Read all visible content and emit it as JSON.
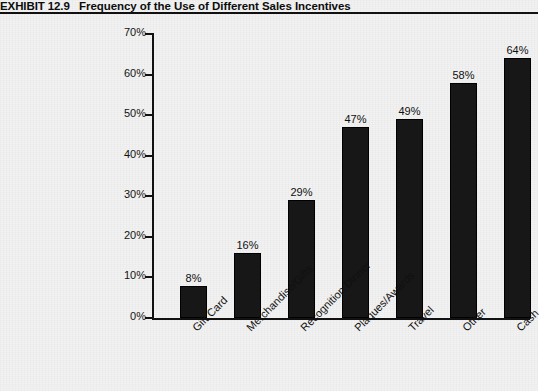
{
  "header": {
    "exhibit_label": "EXHIBIT 12.9",
    "exhibit_title": "Frequency of the Use of Different Sales Incentives"
  },
  "chart_data": {
    "type": "bar",
    "title": "Frequency of the Use of Different Sales Incentives",
    "xlabel": "",
    "ylabel": "",
    "categories": [
      "Gift Card",
      "Merchandise/Gifts",
      "Recognition Dinner",
      "Plaques/Awards",
      "Travel",
      "Other",
      "Cash"
    ],
    "values": [
      8,
      16,
      29,
      47,
      49,
      58,
      64
    ],
    "value_labels": [
      "8%",
      "16%",
      "29%",
      "47%",
      "49%",
      "58%",
      "64%"
    ],
    "ylim": [
      0,
      70
    ],
    "ytick_values": [
      0,
      10,
      20,
      30,
      40,
      50,
      60,
      70
    ],
    "ytick_labels": [
      "0%",
      "10%",
      "20%",
      "30%",
      "40%",
      "50%",
      "60%",
      "70%"
    ],
    "grid": false,
    "legend": "none",
    "bar_color": "#171717",
    "axis_color": "#111111",
    "background_color": "#f2f2f2"
  }
}
